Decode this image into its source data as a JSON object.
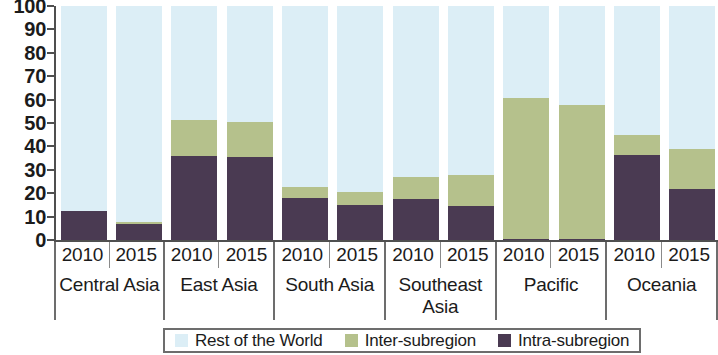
{
  "chart_data": {
    "type": "bar",
    "subtype": "stacked-percentage",
    "title": "",
    "xlabel": "",
    "ylabel": "",
    "ylim": [
      0,
      100
    ],
    "yticks": [
      0,
      10,
      20,
      30,
      40,
      50,
      60,
      70,
      80,
      90,
      100
    ],
    "ytick_labels": [
      "0",
      "10",
      "20",
      "30",
      "40",
      "50",
      "60",
      "70",
      "80",
      "90",
      "100"
    ],
    "grid": false,
    "legend_position": "bottom",
    "categories": [
      "Central Asia 2010",
      "Central Asia 2015",
      "East Asia 2010",
      "East Asia 2015",
      "South Asia 2010",
      "South Asia 2015",
      "Southeast Asia 2010",
      "Southeast Asia 2015",
      "Pacific 2010",
      "Pacific 2015",
      "Oceania 2010",
      "Oceania 2015"
    ],
    "groups": [
      {
        "name": "Central Asia",
        "years": [
          "2010",
          "2015"
        ],
        "bars": [
          {
            "year": "2010",
            "intra_subregion": 12.5,
            "inter_subregion": 0.0,
            "rest_of_world": 87.5
          },
          {
            "year": "2015",
            "intra_subregion": 7.0,
            "inter_subregion": 0.8,
            "rest_of_world": 92.2
          }
        ]
      },
      {
        "name": "East Asia",
        "years": [
          "2010",
          "2015"
        ],
        "bars": [
          {
            "year": "2010",
            "intra_subregion": 36.0,
            "inter_subregion": 15.5,
            "rest_of_world": 48.5
          },
          {
            "year": "2015",
            "intra_subregion": 35.5,
            "inter_subregion": 15.0,
            "rest_of_world": 49.5
          }
        ]
      },
      {
        "name": "South Asia",
        "years": [
          "2010",
          "2015"
        ],
        "bars": [
          {
            "year": "2010",
            "intra_subregion": 18.0,
            "inter_subregion": 4.5,
            "rest_of_world": 77.5
          },
          {
            "year": "2015",
            "intra_subregion": 15.0,
            "inter_subregion": 5.5,
            "rest_of_world": 79.5
          }
        ]
      },
      {
        "name": "Southeast Asia",
        "years": [
          "2010",
          "2015"
        ],
        "bars": [
          {
            "year": "2010",
            "intra_subregion": 17.5,
            "inter_subregion": 9.5,
            "rest_of_world": 73.0
          },
          {
            "year": "2015",
            "intra_subregion": 14.5,
            "inter_subregion": 13.5,
            "rest_of_world": 72.0
          }
        ]
      },
      {
        "name": "Pacific",
        "years": [
          "2010",
          "2015"
        ],
        "bars": [
          {
            "year": "2010",
            "intra_subregion": 0.5,
            "inter_subregion": 60.0,
            "rest_of_world": 39.5
          },
          {
            "year": "2015",
            "intra_subregion": 0.5,
            "inter_subregion": 57.0,
            "rest_of_world": 42.5
          }
        ]
      },
      {
        "name": "Oceania",
        "years": [
          "2010",
          "2015"
        ],
        "bars": [
          {
            "year": "2010",
            "intra_subregion": 36.5,
            "inter_subregion": 8.5,
            "rest_of_world": 55.0
          },
          {
            "year": "2015",
            "intra_subregion": 22.0,
            "inter_subregion": 17.0,
            "rest_of_world": 61.0
          }
        ]
      }
    ],
    "series": [
      {
        "name": "Rest of the World",
        "key": "rest_of_world",
        "color": "#dceef6",
        "values": [
          87.5,
          92.2,
          48.5,
          49.5,
          77.5,
          79.5,
          73.0,
          72.0,
          39.5,
          42.5,
          55.0,
          61.0
        ]
      },
      {
        "name": "Inter-subregion",
        "key": "inter_subregion",
        "color": "#b5c18c",
        "values": [
          0.0,
          0.8,
          15.5,
          15.0,
          4.5,
          5.5,
          9.5,
          13.5,
          60.0,
          57.0,
          8.5,
          17.0
        ]
      },
      {
        "name": "Intra-subregion",
        "key": "intra_subregion",
        "color": "#4a3a52",
        "values": [
          12.5,
          7.0,
          36.0,
          35.5,
          18.0,
          15.0,
          17.5,
          14.5,
          0.5,
          0.5,
          36.5,
          22.0
        ]
      }
    ]
  },
  "legend": {
    "items": [
      {
        "label": "Rest of the World",
        "color": "#dceef6"
      },
      {
        "label": "Inter-subregion",
        "color": "#b5c18c"
      },
      {
        "label": "Intra-subregion",
        "color": "#4a3a52"
      }
    ]
  },
  "colors": {
    "rest_of_world": "#dceef6",
    "inter_subregion": "#b5c18c",
    "intra_subregion": "#4a3a52",
    "axis": "#4f4f4f",
    "text": "#1b1b1b"
  }
}
